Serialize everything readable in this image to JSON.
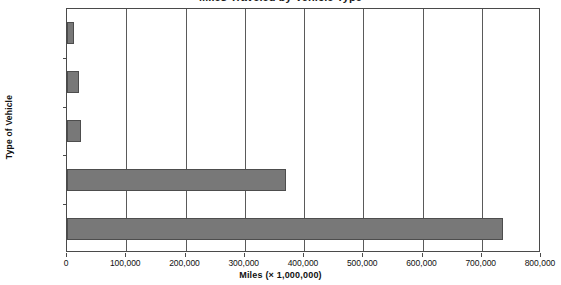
{
  "chart_data": {
    "type": "bar",
    "orientation": "horizontal",
    "title": "Miles Traveled by Vehicle Type",
    "xlabel": "Miles (× 1,000,000)",
    "ylabel": "Type of Vehicle",
    "categories": [
      "Ship",
      "Train",
      "Bus",
      "Airplane",
      "Personal"
    ],
    "values": [
      11000,
      20000,
      23000,
      370000,
      736000
    ],
    "xlim": [
      0,
      800000
    ],
    "xticks": [
      0,
      100000,
      200000,
      300000,
      400000,
      500000,
      600000,
      700000,
      800000
    ],
    "xtick_labels": [
      "0",
      "100,000",
      "200,000",
      "300,000",
      "400,000",
      "500,000",
      "600,000",
      "700,000",
      "800,000"
    ],
    "grid": true,
    "grid_axis": "x",
    "legend": false,
    "bar_color": "#787878",
    "bar_edge_color": "#4d4d4d",
    "axis_color": "#4a4a4a",
    "background": "#ffffff"
  }
}
